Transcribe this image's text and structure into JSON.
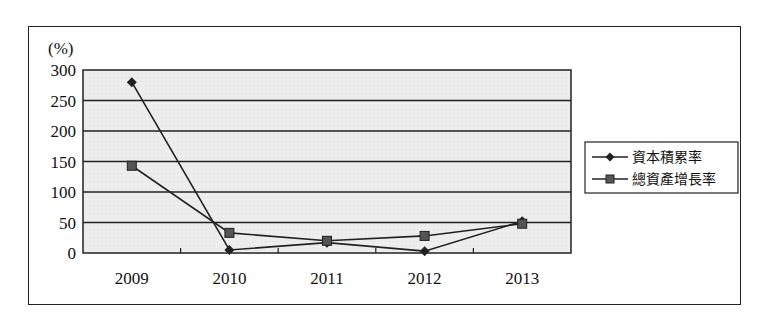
{
  "chart_data": {
    "type": "line",
    "title": "",
    "xlabel": "",
    "ylabel": "(%)",
    "ylim": [
      0,
      300
    ],
    "yticks": [
      0,
      50,
      100,
      150,
      200,
      250,
      300
    ],
    "grid": true,
    "legend_position": "right",
    "categories": [
      "2009",
      "2010",
      "2011",
      "2012",
      "2013"
    ],
    "series": [
      {
        "name": "資本積累率",
        "marker": "diamond",
        "values": [
          280,
          5,
          17,
          3,
          52
        ]
      },
      {
        "name": "總資產增長率",
        "marker": "square",
        "values": [
          143,
          33,
          20,
          28,
          48
        ]
      }
    ]
  },
  "colors": {
    "plot_background": "#ececec",
    "line": "#222222",
    "square_marker_fill": "#555555",
    "frame": "#222222"
  }
}
